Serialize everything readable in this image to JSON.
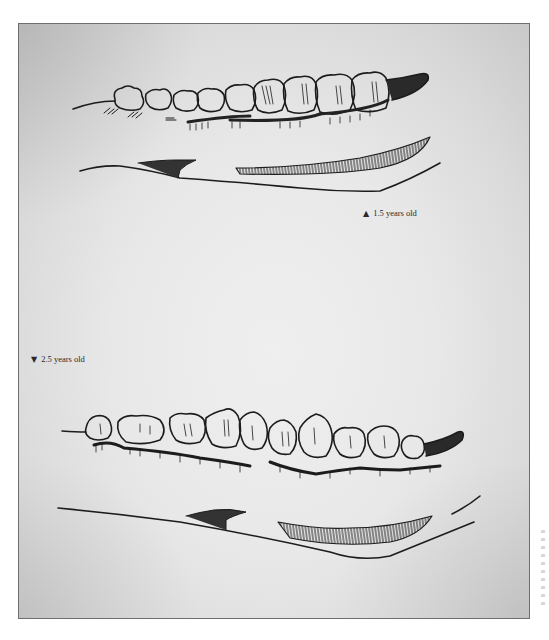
{
  "figure": {
    "colors": {
      "paper": "#e8e8e8",
      "ink": "#1e1e1e",
      "frame_border": "#6e6e6e",
      "caption_text": "#2a2a2a"
    },
    "captions": [
      {
        "id": "upper",
        "marker": "▲",
        "marker_icon": "triangle-up-icon",
        "text": "1.5 years old"
      },
      {
        "id": "lower",
        "marker": "▼",
        "marker_icon": "triangle-down-icon",
        "text": "2.5 years old"
      }
    ],
    "drawings": [
      {
        "id": "jaw-1-5-years",
        "subject": "lower jaw teeth row",
        "age_label": "1.5 years old"
      },
      {
        "id": "jaw-2-5-years",
        "subject": "lower jaw teeth row",
        "age_label": "2.5 years old"
      }
    ]
  }
}
